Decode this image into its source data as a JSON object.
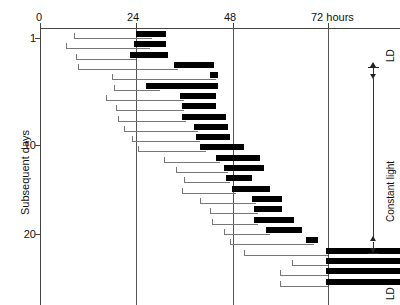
{
  "figure": {
    "type": "actogram",
    "x_axis": {
      "unit_label": "72 hours",
      "ticks": [
        {
          "value": 0,
          "label": "0"
        },
        {
          "value": 24,
          "label": "24"
        },
        {
          "value": 48,
          "label": "48"
        },
        {
          "value": 72,
          "label": "72 hours"
        }
      ],
      "range": [
        0,
        90
      ]
    },
    "y_axis": {
      "title": "Subsequent days",
      "ticks": [
        {
          "value": 1,
          "label": "1"
        },
        {
          "value": 10,
          "label": "10"
        },
        {
          "value": 20,
          "label": "20"
        }
      ],
      "range": [
        1,
        25
      ]
    },
    "annotations": {
      "top_condition": "LD",
      "middle_condition": "Constant light",
      "bottom_condition": "LD"
    }
  },
  "chart_data": {
    "type": "bar",
    "title": "",
    "xlabel": "72 hours",
    "ylabel": "Subsequent days",
    "xlim": [
      0,
      90
    ],
    "ylim": [
      1,
      25
    ],
    "grid": true,
    "gridlines_x": [
      24,
      48,
      72
    ],
    "legend": [],
    "annotations": [
      {
        "text": "LD",
        "position": "right-top"
      },
      {
        "text": "Constant light",
        "position": "right-middle"
      },
      {
        "text": "LD",
        "position": "right-bottom"
      }
    ],
    "series": [
      {
        "name": "daily activity records",
        "note": "each row = one day; line span = record, black bar = active phase",
        "rows": [
          {
            "day": 1,
            "line_start": 8.5,
            "line_end": 28.0,
            "bar_start": 24.0,
            "bar_end": 31.5
          },
          {
            "day": 2,
            "line_start": 6.5,
            "line_end": 27.5,
            "bar_start": 23.5,
            "bar_end": 31.5
          },
          {
            "day": 3,
            "line_start": 9.0,
            "line_end": 24.0,
            "bar_start": 22.5,
            "bar_end": 32.0
          },
          {
            "day": 4,
            "line_start": 9.5,
            "line_end": 34.5,
            "bar_start": 33.5,
            "bar_end": 43.5
          },
          {
            "day": 5,
            "line_start": 18.0,
            "line_end": 44.0,
            "bar_start": 42.5,
            "bar_end": 44.5
          },
          {
            "day": 6,
            "line_start": 18.5,
            "line_end": 30.0,
            "bar_start": 26.5,
            "bar_end": 44.5
          },
          {
            "day": 7,
            "line_start": 16.5,
            "line_end": 36.0,
            "bar_start": 35.0,
            "bar_end": 44.0
          },
          {
            "day": 8,
            "line_start": 19.0,
            "line_end": 36.0,
            "bar_start": 35.5,
            "bar_end": 44.0
          },
          {
            "day": 9,
            "line_start": 19.5,
            "line_end": 36.5,
            "bar_start": 35.5,
            "bar_end": 46.5
          },
          {
            "day": 10,
            "line_start": 21.0,
            "line_end": 39.5,
            "bar_start": 38.5,
            "bar_end": 47.0
          },
          {
            "day": 11,
            "line_start": 23.0,
            "line_end": 40.0,
            "bar_start": 39.0,
            "bar_end": 47.5
          },
          {
            "day": 12,
            "line_start": 24.5,
            "line_end": 41.5,
            "bar_start": 40.0,
            "bar_end": 51.0
          },
          {
            "day": 13,
            "line_start": 31.0,
            "line_end": 45.0,
            "bar_start": 44.0,
            "bar_end": 55.0
          },
          {
            "day": 14,
            "line_start": 34.0,
            "line_end": 47.0,
            "bar_start": 46.0,
            "bar_end": 56.0
          },
          {
            "day": 15,
            "line_start": 36.0,
            "line_end": 47.5,
            "bar_start": 46.5,
            "bar_end": 53.0
          },
          {
            "day": 16,
            "line_start": 35.5,
            "line_end": 49.0,
            "bar_start": 48.0,
            "bar_end": 57.5
          },
          {
            "day": 17,
            "line_start": 40.0,
            "line_end": 54.0,
            "bar_start": 53.0,
            "bar_end": 60.5
          },
          {
            "day": 18,
            "line_start": 42.5,
            "line_end": 54.5,
            "bar_start": 53.5,
            "bar_end": 60.5
          },
          {
            "day": 19,
            "line_start": 43.0,
            "line_end": 54.5,
            "bar_start": 53.5,
            "bar_end": 63.5
          },
          {
            "day": 20,
            "line_start": 46.0,
            "line_end": 57.5,
            "bar_start": 56.5,
            "bar_end": 65.5
          },
          {
            "day": 21,
            "line_start": 47.5,
            "line_end": 68.5,
            "bar_start": 66.5,
            "bar_end": 69.5
          },
          {
            "day": 22,
            "line_start": 51.0,
            "line_end": 72.0,
            "bar_start": 71.5,
            "bar_end": 97.0
          },
          {
            "day": 23,
            "line_start": 63.0,
            "line_end": 72.0,
            "bar_start": 71.5,
            "bar_end": 97.0
          },
          {
            "day": 24,
            "line_start": 60.0,
            "line_end": 72.0,
            "bar_start": 71.5,
            "bar_end": 97.0
          },
          {
            "day": 25,
            "line_start": 60.0,
            "line_end": 72.0,
            "bar_start": 71.5,
            "bar_end": 97.0
          }
        ]
      }
    ]
  }
}
